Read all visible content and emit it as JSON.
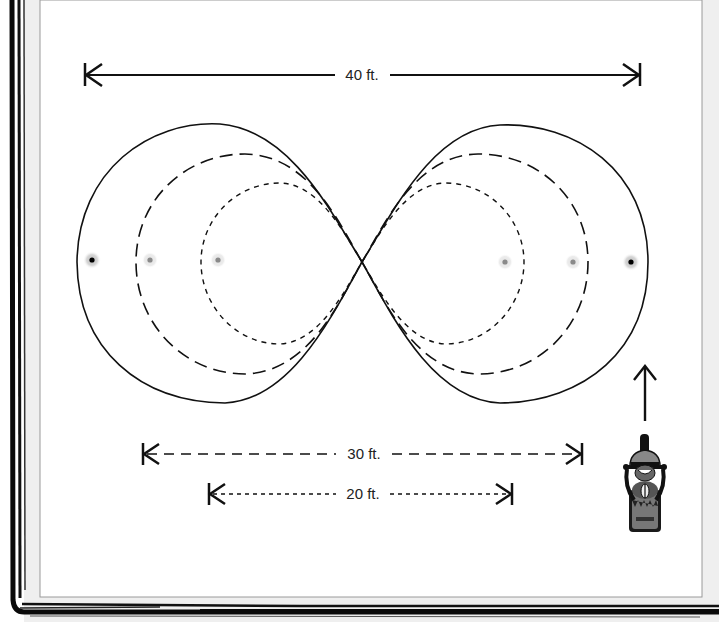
{
  "diagram": {
    "type": "figure-eight riding course",
    "dimensions": {
      "overall": {
        "label": "40 ft.",
        "style": "solid"
      },
      "middle": {
        "label": "30 ft.",
        "style": "long-dash"
      },
      "inner": {
        "label": "20 ft.",
        "style": "short-dash"
      }
    },
    "paths": [
      {
        "name": "outer-path",
        "style": "solid",
        "width_ft": 40
      },
      {
        "name": "middle-path",
        "style": "long-dash",
        "width_ft": 30
      },
      {
        "name": "inner-path",
        "style": "short-dash",
        "width_ft": 20
      }
    ],
    "cones": [
      {
        "position": "left-outer",
        "color": "#000000"
      },
      {
        "position": "left-middle",
        "color": "#8a8a8a"
      },
      {
        "position": "left-inner",
        "color": "#8a8a8a"
      },
      {
        "position": "right-inner",
        "color": "#8a8a8a"
      },
      {
        "position": "right-middle",
        "color": "#8a8a8a"
      },
      {
        "position": "right-outer",
        "color": "#000000"
      }
    ],
    "direction_arrow": "arrow-up-icon",
    "vehicle": "motorcycle-rider-icon"
  },
  "colors": {
    "line": "#111111",
    "paper": "#ffffff",
    "frame": "#0a0a0a",
    "frame_texture": "#ededed",
    "inner_border": "#9a9a9a"
  }
}
